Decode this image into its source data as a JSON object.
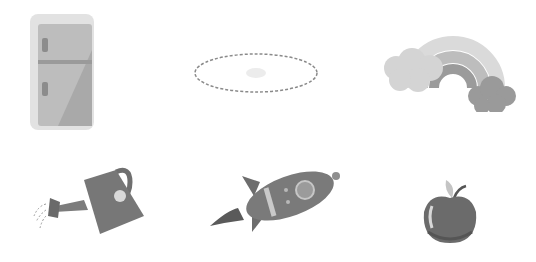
{
  "grid": {
    "rows": 2,
    "columns": 3,
    "items": [
      {
        "name": "refrigerator",
        "icon": "refrigerator-icon"
      },
      {
        "name": "empty-dashed-oval",
        "icon": "dashed-oval-icon"
      },
      {
        "name": "rainbow-with-clouds",
        "icon": "rainbow-icon"
      },
      {
        "name": "watering-can",
        "icon": "watering-can-icon"
      },
      {
        "name": "rocket",
        "icon": "rocket-icon"
      },
      {
        "name": "apple",
        "icon": "apple-icon"
      }
    ]
  },
  "colors": {
    "background": "#ffffff",
    "light_gray": "#e4e4e4",
    "mid_gray": "#a8a8a8",
    "dark_gray": "#6e6e6e"
  }
}
